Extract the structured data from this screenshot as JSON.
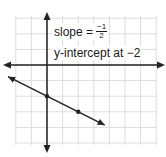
{
  "diagram": {
    "type": "coordinate-plane-line",
    "grid": {
      "x_min": -2,
      "x_max": 7,
      "y_min": -5,
      "y_max": 3,
      "x_range_px": [
        16,
        157
      ],
      "y_range_px": [
        16,
        145
      ]
    },
    "origin_px": [
      47,
      65
    ],
    "unit_px": 15.6,
    "colors": {
      "grid": "#dddddd",
      "axis": "#222222",
      "line": "#222222",
      "text": "#1a1a1a",
      "background": "#ffffff"
    },
    "line": {
      "slope": -0.5,
      "y_intercept": -2,
      "points": [
        {
          "x": 0,
          "y": -2
        },
        {
          "x": 2,
          "y": -3
        }
      ],
      "arrow_start": {
        "x": -2.5,
        "y": -0.75
      },
      "arrow_end": {
        "x": 3.7,
        "y": -3.85
      }
    },
    "labels": {
      "slope_prefix": "slope =",
      "slope_numerator": "−1",
      "slope_denominator": "2",
      "intercept": "y-intercept at −2"
    }
  }
}
